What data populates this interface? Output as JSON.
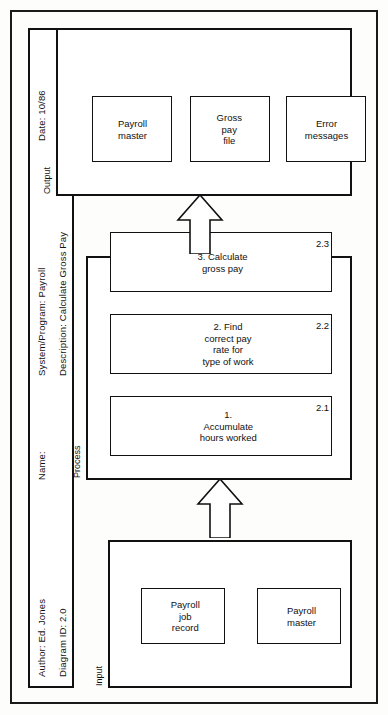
{
  "document": {
    "type": "IPO / HIPO chart",
    "orientation": "landscape sheet rotated 90 degrees counter-clockwise"
  },
  "header": {
    "author_label": "Author: Ed. Jones",
    "diagram_id_label": "Diagram ID: 2.0",
    "name_label": "Name:",
    "system_program_label": "System/Program:  Payroll",
    "description_label": "Description: Calculate Gross Pay",
    "date_label": "Date:  10/86"
  },
  "sections": {
    "input": {
      "label": "Input",
      "items": [
        {
          "text": "Payroll\njob\nrecord"
        },
        {
          "text": "Payroll\nmaster"
        }
      ]
    },
    "process": {
      "label": "Process",
      "items": [
        {
          "text": "1. Accumulate hours worked",
          "number": "2.1"
        },
        {
          "text": "2. Find correct pay rate for\ntype of work",
          "number": "2.2"
        },
        {
          "text": "3. Calculate gross pay",
          "number": "2.3"
        }
      ]
    },
    "output": {
      "label": "Output",
      "items": [
        {
          "text": "Payroll\nmaster"
        },
        {
          "text": "Gross\npay\nfile"
        },
        {
          "text": "Error\nmessages"
        }
      ]
    }
  },
  "arrows": [
    {
      "name": "input-to-process",
      "direction": "right"
    },
    {
      "name": "process-to-output",
      "direction": "right"
    }
  ],
  "colors": {
    "ink": "#111111",
    "paper": "#fdfdfc"
  }
}
